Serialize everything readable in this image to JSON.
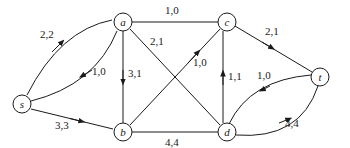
{
  "diagram": {
    "type": "flow-network",
    "colors": {
      "stroke": "#1a1a1a",
      "background": "#ffffff"
    },
    "nodes": [
      {
        "id": "s",
        "label": "s",
        "x": 22,
        "y": 104
      },
      {
        "id": "a",
        "label": "a",
        "x": 123,
        "y": 22
      },
      {
        "id": "c",
        "label": "c",
        "x": 227,
        "y": 22
      },
      {
        "id": "t",
        "label": "t",
        "x": 320,
        "y": 77
      },
      {
        "id": "b",
        "label": "b",
        "x": 123,
        "y": 132
      },
      {
        "id": "d",
        "label": "d",
        "x": 227,
        "y": 132
      }
    ],
    "edges": [
      {
        "from": "s",
        "to": "a",
        "label": "2,2",
        "directed": true
      },
      {
        "from": "a",
        "to": "s",
        "label": "1,0",
        "directed": true
      },
      {
        "from": "s",
        "to": "b",
        "label": "3,3",
        "directed": true
      },
      {
        "from": "a",
        "to": "b",
        "label": "3,1",
        "directed": true
      },
      {
        "from": "a",
        "to": "c",
        "label": "1,0",
        "directed": false
      },
      {
        "from": "a",
        "to": "d",
        "label": "2,1",
        "directed": false
      },
      {
        "from": "b",
        "to": "c",
        "label": "1,0",
        "directed": true
      },
      {
        "from": "b",
        "to": "d",
        "label": "4,4",
        "directed": false
      },
      {
        "from": "d",
        "to": "c",
        "label": "1,1",
        "directed": true
      },
      {
        "from": "c",
        "to": "t",
        "label": "2,1",
        "directed": true
      },
      {
        "from": "t",
        "to": "d",
        "label": "1,0",
        "directed": true
      },
      {
        "from": "d",
        "to": "t",
        "label": "4,4",
        "directed": true
      }
    ]
  }
}
